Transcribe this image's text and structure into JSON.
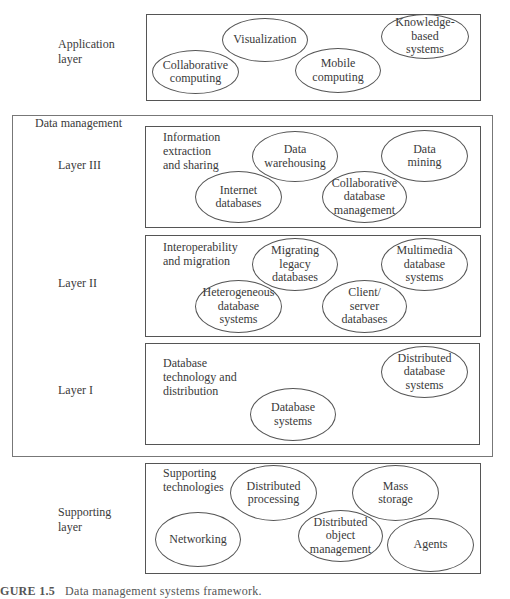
{
  "diagram": {
    "application": {
      "side_label": "Application\nlayer",
      "nodes": [
        {
          "label": "Visualization",
          "x": 222,
          "y": 18,
          "w": 86,
          "h": 44
        },
        {
          "label": "Collaborative\ncomputing",
          "x": 152,
          "y": 50,
          "w": 87,
          "h": 44
        },
        {
          "label": "Mobile\ncomputing",
          "x": 295,
          "y": 48,
          "w": 86,
          "h": 45
        },
        {
          "label": "Knowledge-\nbased\nsystems",
          "x": 381,
          "y": 14,
          "w": 88,
          "h": 45
        }
      ]
    },
    "data_management": {
      "title": "Data management",
      "layer3": {
        "side_label": "Layer III",
        "group_label": "Information\nextraction\nand sharing",
        "nodes": [
          {
            "label": "Data\nwarehousing",
            "x": 252,
            "y": 131,
            "w": 86,
            "h": 51
          },
          {
            "label": "Data\nmining",
            "x": 381,
            "y": 130,
            "w": 87,
            "h": 52
          },
          {
            "label": "Internet\ndatabases",
            "x": 195,
            "y": 171,
            "w": 87,
            "h": 52
          },
          {
            "label": "Collaborative\ndatabase\nmanagement",
            "x": 322,
            "y": 171,
            "w": 85,
            "h": 52
          }
        ]
      },
      "layer2": {
        "side_label": "Layer II",
        "group_label": "Interoperability\nand migration",
        "nodes": [
          {
            "label": "Migrating\nlegacy\ndatabases",
            "x": 252,
            "y": 238,
            "w": 86,
            "h": 53
          },
          {
            "label": "Multimedia\ndatabase\nsystems",
            "x": 381,
            "y": 238,
            "w": 87,
            "h": 53
          },
          {
            "label": "Heterogeneous\ndatabase\nsystems",
            "x": 195,
            "y": 280,
            "w": 87,
            "h": 53
          },
          {
            "label": "Client/\nserver\ndatabases",
            "x": 322,
            "y": 280,
            "w": 85,
            "h": 53
          }
        ]
      },
      "layer1": {
        "side_label": "Layer I",
        "group_label": "Database\ntechnology and\ndistribution",
        "nodes": [
          {
            "label": "Distributed\ndatabase\nsystems",
            "x": 381,
            "y": 346,
            "w": 87,
            "h": 52
          },
          {
            "label": "Database\nsystems",
            "x": 250,
            "y": 388,
            "w": 86,
            "h": 53
          }
        ]
      }
    },
    "supporting": {
      "side_label": "Supporting\nlayer",
      "group_label": "Supporting\ntechnologies",
      "nodes": [
        {
          "label": "Distributed\nprocessing",
          "x": 230,
          "y": 465,
          "w": 87,
          "h": 56
        },
        {
          "label": "Mass\nstorage",
          "x": 352,
          "y": 465,
          "w": 87,
          "h": 56
        },
        {
          "label": "Networking",
          "x": 155,
          "y": 512,
          "w": 86,
          "h": 55
        },
        {
          "label": "Distributed\nobject\nmanagement",
          "x": 298,
          "y": 510,
          "w": 85,
          "h": 52
        },
        {
          "label": "Agents",
          "x": 387,
          "y": 518,
          "w": 87,
          "h": 54
        }
      ]
    },
    "caption": {
      "figure": "GURE 1.5",
      "text": "Data management systems framework."
    }
  }
}
